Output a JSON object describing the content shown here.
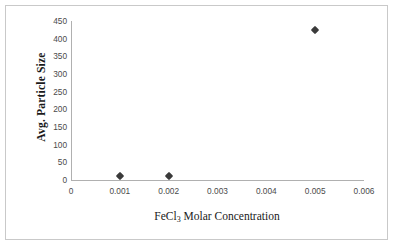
{
  "chart_data": {
    "type": "scatter",
    "title": "",
    "xlabel": "FeCl3 Molar Concentration",
    "xlabel_prefix": "FeCl",
    "xlabel_sub": "3",
    "xlabel_suffix": " Molar Concentration",
    "ylabel": "Avg. Particle Size",
    "x": [
      0.001,
      0.002,
      0.005
    ],
    "values": [
      10,
      10,
      425
    ],
    "series": [
      {
        "name": "Avg. Particle Size",
        "points": [
          {
            "x": 0.001,
            "y": 10
          },
          {
            "x": 0.002,
            "y": 10
          },
          {
            "x": 0.005,
            "y": 425
          }
        ],
        "marker": "diamond",
        "color": "#3a3a3a"
      }
    ],
    "xlim": [
      0,
      0.006
    ],
    "ylim": [
      0,
      450
    ],
    "xticks": [
      0,
      0.001,
      0.002,
      0.003,
      0.004,
      0.005,
      0.006
    ],
    "xticklabels": [
      "0",
      "0.001",
      "0.002",
      "0.003",
      "0.004",
      "0.005",
      "0.006"
    ],
    "yticks": [
      0,
      50,
      100,
      150,
      200,
      250,
      300,
      350,
      400,
      450
    ],
    "yticklabels": [
      "0",
      "50",
      "100",
      "150",
      "200",
      "250",
      "300",
      "350",
      "400",
      "450"
    ],
    "grid": false,
    "legend": false,
    "legend_position": "none",
    "axis_color": "#b0b0b0",
    "text_color": "#4a4a4a",
    "border_color": "#c9c9c9",
    "background": "#ffffff"
  }
}
